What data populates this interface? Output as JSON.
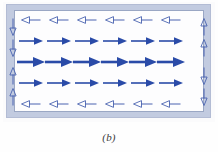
{
  "figure": {
    "caption": "(b)",
    "kind": "vector-field-diagram",
    "colors": {
      "arrow_fill": "#2a4ba8",
      "arrow_outline": "#4a63b0",
      "slab_frame": "#c2cbe0",
      "slab_border": "#b3bcd4",
      "field_background": "#fdfdfe",
      "field_border": "#9aa7c4",
      "page_background": "#ffffff",
      "caption_color": "#3b3b3b"
    },
    "geometry": {
      "slab": {
        "x": 6,
        "y": 4,
        "width": 205,
        "height": 114
      },
      "field_region": {
        "x": 14,
        "y": 10,
        "width": 190,
        "height": 102
      },
      "columns": 6,
      "rows": 5
    }
  },
  "rows": [
    {
      "name": "top-return-row",
      "direction": "left",
      "style": "hollow",
      "y": 20,
      "length": 19,
      "head": 8,
      "thickness": 1.0,
      "count": 6
    },
    {
      "name": "upper-interior-row",
      "direction": "right",
      "style": "filled",
      "y": 41,
      "length": 24,
      "head": 9,
      "thickness": 1.6,
      "count": 6
    },
    {
      "name": "center-interior-row",
      "direction": "right",
      "style": "filled",
      "y": 62,
      "length": 28,
      "head": 12,
      "thickness": 2.6,
      "count": 6
    },
    {
      "name": "lower-interior-row",
      "direction": "right",
      "style": "filled",
      "y": 83,
      "length": 24,
      "head": 9,
      "thickness": 1.6,
      "count": 6
    },
    {
      "name": "bottom-return-row",
      "direction": "left",
      "style": "hollow",
      "y": 104,
      "length": 19,
      "head": 8,
      "thickness": 1.0,
      "count": 6
    }
  ],
  "row_x_positions": [
    31,
    59,
    87,
    115,
    143,
    171
  ],
  "edge_arrows": {
    "left": {
      "x": 13,
      "style": "hollow",
      "items": [
        {
          "name": "left-edge-down-1",
          "direction": "down",
          "y": 27,
          "length": 17
        },
        {
          "name": "left-edge-down-2",
          "direction": "down",
          "y": 48,
          "length": 17
        },
        {
          "name": "left-edge-up-1",
          "direction": "up",
          "y": 76,
          "length": 17
        },
        {
          "name": "left-edge-up-2",
          "direction": "up",
          "y": 97,
          "length": 17
        }
      ]
    },
    "right": {
      "x": 204,
      "style": "hollow",
      "items": [
        {
          "name": "right-edge-up-1",
          "direction": "up",
          "y": 27,
          "length": 17
        },
        {
          "name": "right-edge-up-2",
          "direction": "up",
          "y": 48,
          "length": 17
        },
        {
          "name": "right-edge-down-1",
          "direction": "down",
          "y": 76,
          "length": 17
        },
        {
          "name": "right-edge-down-2",
          "direction": "down",
          "y": 97,
          "length": 17
        }
      ]
    }
  }
}
